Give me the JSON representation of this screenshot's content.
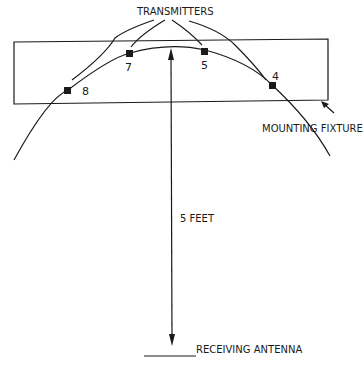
{
  "diagram": {
    "title_label": "TRANSMITTERS",
    "fixture_label": "MOUNTING FIXTURE",
    "distance_label": "5 FEET",
    "antenna_label": "RECEIVING ANTENNA",
    "transmitters": [
      {
        "id": "8",
        "label": "8"
      },
      {
        "id": "7",
        "label": "7"
      },
      {
        "id": "5",
        "label": "5"
      },
      {
        "id": "4",
        "label": "4"
      }
    ],
    "colors": {
      "ink": "#1a1a1a",
      "background": "#ffffff"
    }
  }
}
